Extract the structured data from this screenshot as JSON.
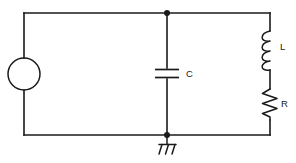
{
  "diagram": {
    "type": "electrical-schematic",
    "background_color": "#ffffff",
    "line_color": "#1a1a1a"
  },
  "components": {
    "source": {
      "label": "",
      "symbol": "circle-source",
      "name": "voltage-source"
    },
    "capacitor": {
      "label": "C",
      "symbol": "parallel-plates",
      "name": "capacitor"
    },
    "inductor": {
      "label": "L",
      "symbol": "coil",
      "coil_turns": 4,
      "name": "inductor"
    },
    "resistor": {
      "label": "R",
      "symbol": "zigzag",
      "zigzag_peaks": 6,
      "name": "resistor"
    },
    "ground": {
      "label": "",
      "symbol": "hatched-ground",
      "hatch_lines": 3,
      "name": "ground"
    }
  },
  "nodes": {
    "top_junction": "",
    "bottom_junction": ""
  }
}
